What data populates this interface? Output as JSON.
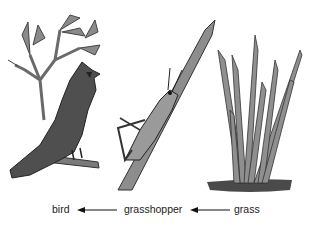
{
  "diagram": {
    "type": "food-chain",
    "organisms": [
      {
        "id": "bird",
        "label": "bird",
        "icon": "cardinal-bird-on-branch"
      },
      {
        "id": "grasshopper",
        "label": "grasshopper",
        "icon": "grasshopper-on-grass-blade"
      },
      {
        "id": "grass",
        "label": "grass",
        "icon": "grass-clump"
      }
    ],
    "arrows": [
      {
        "from": "grass",
        "to": "grasshopper"
      },
      {
        "from": "grasshopper",
        "to": "bird"
      }
    ],
    "colors": {
      "ink": "#222222",
      "fill_dark": "#555555",
      "fill_mid": "#8a8a8a",
      "fill_light": "#b5b5b5",
      "background": "#ffffff"
    }
  }
}
